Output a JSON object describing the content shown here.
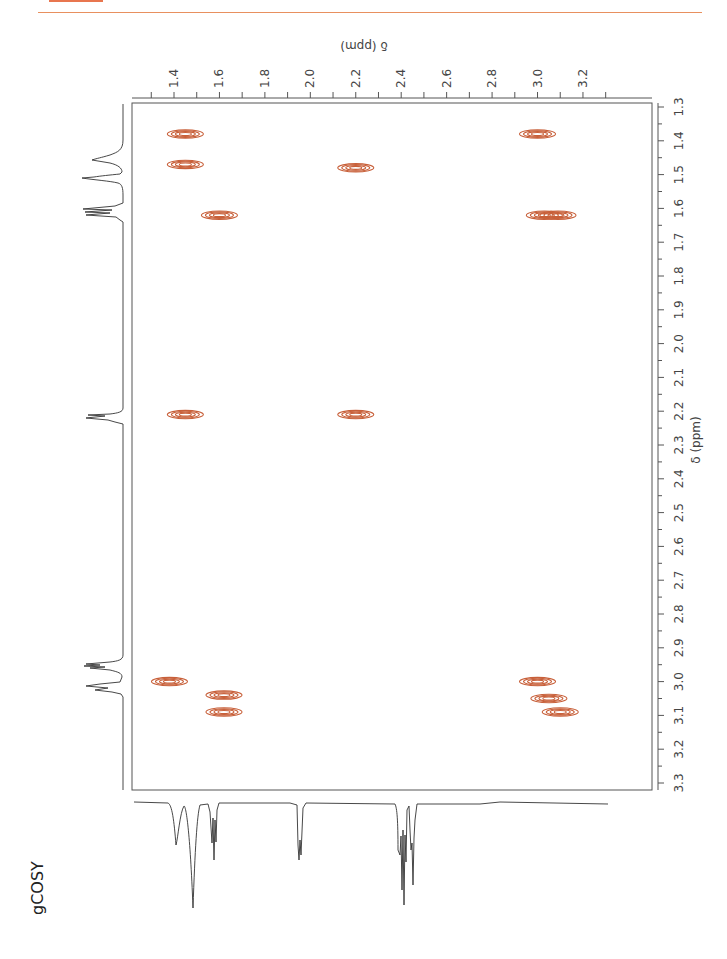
{
  "header": {
    "accent_color": "#e8764f"
  },
  "caption": {
    "label": "gCOSY"
  },
  "chart_data": {
    "type": "heatmap",
    "subtype": "2D NMR gCOSY contour plot (rotated 90°)",
    "title": "gCOSY",
    "top_axis": {
      "label": "δ (ppm)",
      "ticks": [
        "1.4",
        "1.6",
        "1.8",
        "2.0",
        "2.2",
        "2.4",
        "2.6",
        "2.8",
        "3.0",
        "3.2"
      ],
      "range": [
        1.32,
        3.35
      ]
    },
    "right_axis": {
      "label": "δ (ppm)",
      "ticks": [
        "1.3",
        "1.4",
        "1.5",
        "1.6",
        "1.7",
        "1.8",
        "1.9",
        "2.0",
        "2.1",
        "2.2",
        "2.3",
        "2.4",
        "2.5",
        "2.6",
        "2.7",
        "2.8",
        "2.9",
        "3.0",
        "3.1",
        "3.2",
        "3.3"
      ],
      "range": [
        1.3,
        3.3
      ]
    },
    "contour_color": "#c8603a",
    "cross_peaks": [
      {
        "f2": 1.45,
        "f1": 1.38,
        "label": "diag-1.4"
      },
      {
        "f2": 1.45,
        "f1": 1.47,
        "label": "diag-1.45"
      },
      {
        "f2": 1.6,
        "f1": 1.62,
        "label": "diag-1.6"
      },
      {
        "f2": 2.2,
        "f1": 1.48,
        "label": "1.48/2.2"
      },
      {
        "f2": 3.0,
        "f1": 1.38,
        "label": "1.38/3.0"
      },
      {
        "f2": 3.03,
        "f1": 1.62,
        "label": "1.62/3.03"
      },
      {
        "f2": 3.09,
        "f1": 1.62,
        "label": "1.62/3.09"
      },
      {
        "f2": 1.45,
        "f1": 2.21,
        "label": "2.21/1.45"
      },
      {
        "f2": 2.2,
        "f1": 2.21,
        "label": "diag-2.2"
      },
      {
        "f2": 1.38,
        "f1": 3.0,
        "label": "3.0/1.38"
      },
      {
        "f2": 1.62,
        "f1": 3.04,
        "label": "3.04/1.62"
      },
      {
        "f2": 1.62,
        "f1": 3.09,
        "label": "3.09/1.62"
      },
      {
        "f2": 3.0,
        "f1": 3.0,
        "label": "diag-3.0"
      },
      {
        "f2": 3.05,
        "f1": 3.05,
        "label": "diag-3.05"
      },
      {
        "f2": 3.1,
        "f1": 3.09,
        "label": "diag-3.1"
      }
    ],
    "projections": {
      "left": "1H spectrum along right axis (peaks at 1.40, 1.48, 1.62, 2.21, 3.02, 3.09 ppm)",
      "bottom": "1H spectrum along top axis (peaks at 1.40, 1.48, 1.62, 2.21, 3.02, 3.09 ppm)"
    }
  }
}
